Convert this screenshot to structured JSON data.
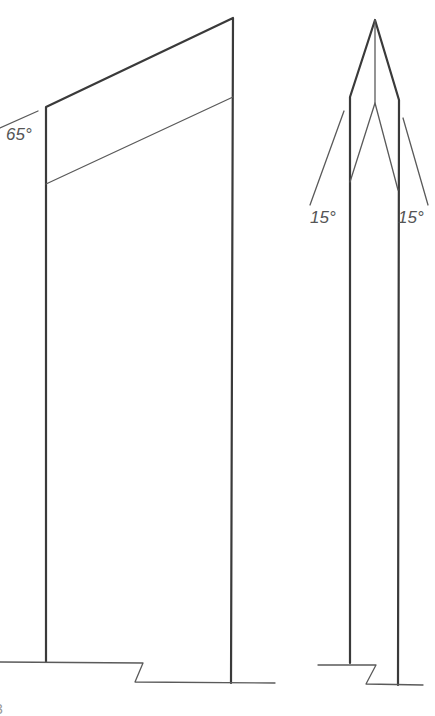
{
  "diagram": {
    "type": "technical-drawing",
    "colors": {
      "line": "#3a3a3a",
      "label": "#555555",
      "background": "#ffffff"
    },
    "left_view": {
      "angle_label": "65°"
    },
    "right_view": {
      "left_angle_label": "15°",
      "right_angle_label": "15°"
    },
    "corner_fragment": "3"
  }
}
